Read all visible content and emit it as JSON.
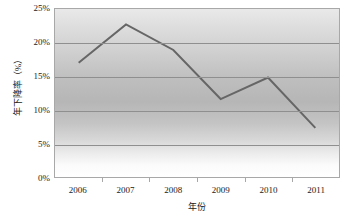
{
  "chart_data": {
    "type": "line",
    "title": "",
    "subtitle": "",
    "xlabel": "年份",
    "ylabel": "年下降率（%）",
    "categories": [
      "2006",
      "2007",
      "2008",
      "2009",
      "2010",
      "2011"
    ],
    "x": [
      2006,
      2007,
      2008,
      2009,
      2010,
      2011
    ],
    "series": [
      {
        "name": "年下降率",
        "values": [
          17.0,
          22.7,
          18.9,
          11.6,
          14.8,
          7.3
        ],
        "color": "#666666"
      }
    ],
    "values": [
      17.0,
      22.7,
      18.9,
      11.6,
      14.8,
      7.3
    ],
    "ylim": [
      0,
      25
    ],
    "ytick_values": [
      0,
      5,
      10,
      15,
      20,
      25
    ],
    "ytick_labels": [
      "0%",
      "5%",
      "10%",
      "15%",
      "20%",
      "25%"
    ],
    "xtick_labels": [
      "2006",
      "2007",
      "2008",
      "2009",
      "2010",
      "2011"
    ],
    "grid": true,
    "grid_axis": "y",
    "legend": false,
    "legend_position": "none",
    "markers": false,
    "annotations": [],
    "plot_background": "vertical-gray-gradient",
    "grid_color": "#8f8f8f",
    "border_color": "#a8a8a8",
    "line_color": "#666666",
    "line_width": 2
  }
}
